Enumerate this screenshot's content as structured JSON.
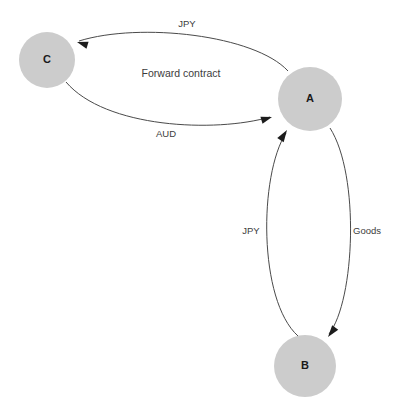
{
  "diagram": {
    "type": "directed-graph",
    "title": "",
    "background_color": "#ffffff",
    "node_fill_color": "#cccccc",
    "edge_color": "#4a4a4a",
    "label_color": "#3c3c3c",
    "nodes": [
      {
        "id": "C",
        "label": "C",
        "cx": 47,
        "cy": 60,
        "r": 28
      },
      {
        "id": "A",
        "label": "A",
        "cx": 310,
        "cy": 99,
        "r": 32
      },
      {
        "id": "B",
        "label": "B",
        "cx": 305,
        "cy": 366,
        "r": 31
      }
    ],
    "edges": [
      {
        "id": "a-to-c",
        "from": "A",
        "to": "C",
        "label": "JPY",
        "label_x": 187,
        "label_y": 24,
        "path": "M 288 71 C 255 35 140 22 79 41",
        "arrow_x": 77,
        "arrow_y": 42,
        "arrow_angle": 197
      },
      {
        "id": "c-to-a",
        "from": "C",
        "to": "A",
        "label": "AUD",
        "label_x": 166,
        "label_y": 134,
        "path": "M 66 82 C 105 128 215 133 270 117",
        "arrow_x": 272,
        "arrow_y": 117,
        "arrow_angle": -17
      },
      {
        "id": "forward-contract",
        "from": "C",
        "to": "A",
        "label": "Forward contract",
        "label_x": 181,
        "label_y": 74,
        "path": "",
        "arrow_x": null,
        "arrow_y": null,
        "arrow_angle": null
      },
      {
        "id": "b-to-a",
        "from": "B",
        "to": "A",
        "label": "JPY",
        "label_x": 251,
        "label_y": 231,
        "path": "M 298 336 C 258 300 259 175 286 133",
        "arrow_x": 287,
        "arrow_y": 130,
        "arrow_angle": -57
      },
      {
        "id": "a-to-b",
        "from": "A",
        "to": "B",
        "label": "Goods",
        "label_x": 367,
        "label_y": 231,
        "path": "M 330 128 C 360 175 355 300 329 334",
        "arrow_x": 328,
        "arrow_y": 337,
        "arrow_angle": 127
      }
    ]
  }
}
